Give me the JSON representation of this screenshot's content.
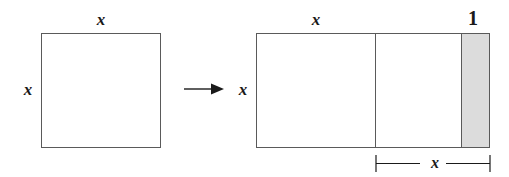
{
  "figure": {
    "colors": {
      "stroke": "#5a5a5a",
      "shaded_fill": "#dcdcdc",
      "text": "#1a1a1a",
      "background": "#ffffff"
    },
    "left_shape": {
      "name": "square",
      "top_label": "x",
      "left_label": "x"
    },
    "transform": {
      "arrow_glyph": "→",
      "direction": "right"
    },
    "right_shape": {
      "name": "rectangle",
      "top_label": "x",
      "left_label": "x",
      "shaded_top_label": "1",
      "bottom_dimension_label": "x"
    }
  }
}
